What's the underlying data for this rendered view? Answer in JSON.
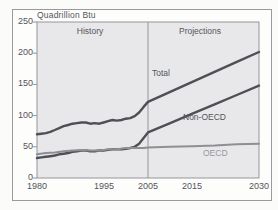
{
  "chart_data": {
    "type": "line",
    "title": "Quadrillion Btu",
    "xlabel": "",
    "ylabel": "Quadrillion Btu",
    "xlim": [
      1980,
      2030
    ],
    "ylim": [
      0,
      250
    ],
    "grid": false,
    "plot_bg": "#e8e8ea",
    "axis_color": "#96969a",
    "text_color": "#54545a",
    "divider_year": 2005,
    "region_labels": {
      "history": "History",
      "projections": "Projections"
    },
    "y_ticks": [
      250,
      200,
      150,
      100,
      50,
      0
    ],
    "y_tick_labels": [
      "250",
      "200",
      "150",
      "100",
      "50",
      "0"
    ],
    "x_ticks": [
      1980,
      1995,
      2005,
      2015,
      2030
    ],
    "x_tick_labels": [
      "1980",
      "1995",
      "2005",
      "2015",
      "2030"
    ],
    "series": [
      {
        "name": "Total",
        "color": "#4f4f56",
        "width": 2.4,
        "points": [
          [
            1980,
            70
          ],
          [
            1981,
            71
          ],
          [
            1982,
            72
          ],
          [
            1983,
            74
          ],
          [
            1984,
            77
          ],
          [
            1985,
            80
          ],
          [
            1986,
            83
          ],
          [
            1987,
            85
          ],
          [
            1988,
            87
          ],
          [
            1989,
            88
          ],
          [
            1990,
            89
          ],
          [
            1991,
            89
          ],
          [
            1992,
            87
          ],
          [
            1993,
            88
          ],
          [
            1994,
            87
          ],
          [
            1995,
            89
          ],
          [
            1996,
            91
          ],
          [
            1997,
            93
          ],
          [
            1998,
            92
          ],
          [
            1999,
            93
          ],
          [
            2000,
            95
          ],
          [
            2001,
            96
          ],
          [
            2002,
            99
          ],
          [
            2003,
            105
          ],
          [
            2004,
            114
          ],
          [
            2005,
            122
          ],
          [
            2010,
            138
          ],
          [
            2015,
            154
          ],
          [
            2020,
            170
          ],
          [
            2025,
            186
          ],
          [
            2030,
            202
          ]
        ]
      },
      {
        "name": "Non-OECD",
        "color": "#4f4f56",
        "width": 2.4,
        "points": [
          [
            1980,
            32
          ],
          [
            1981,
            33
          ],
          [
            1982,
            34
          ],
          [
            1983,
            35
          ],
          [
            1984,
            36
          ],
          [
            1985,
            38
          ],
          [
            1986,
            39
          ],
          [
            1987,
            40
          ],
          [
            1988,
            42
          ],
          [
            1989,
            43
          ],
          [
            1990,
            44
          ],
          [
            1991,
            44
          ],
          [
            1992,
            43
          ],
          [
            1993,
            43
          ],
          [
            1994,
            44
          ],
          [
            1995,
            44
          ],
          [
            1996,
            45
          ],
          [
            1997,
            46
          ],
          [
            1998,
            46
          ],
          [
            1999,
            46
          ],
          [
            2000,
            47
          ],
          [
            2001,
            48
          ],
          [
            2002,
            50
          ],
          [
            2003,
            55
          ],
          [
            2004,
            64
          ],
          [
            2005,
            73
          ],
          [
            2010,
            88
          ],
          [
            2015,
            103
          ],
          [
            2020,
            118
          ],
          [
            2025,
            133
          ],
          [
            2030,
            148
          ]
        ]
      },
      {
        "name": "OECD",
        "color": "#8f8f93",
        "width": 2,
        "points": [
          [
            1980,
            38
          ],
          [
            1982,
            40
          ],
          [
            1984,
            41
          ],
          [
            1986,
            43
          ],
          [
            1988,
            44
          ],
          [
            1990,
            45
          ],
          [
            1992,
            44
          ],
          [
            1994,
            44
          ],
          [
            1995,
            45
          ],
          [
            1996,
            46
          ],
          [
            1998,
            46
          ],
          [
            2000,
            48
          ],
          [
            2002,
            48
          ],
          [
            2004,
            48
          ],
          [
            2005,
            49
          ],
          [
            2010,
            50
          ],
          [
            2015,
            51
          ],
          [
            2020,
            52
          ],
          [
            2025,
            54
          ],
          [
            2030,
            55
          ]
        ]
      }
    ]
  }
}
